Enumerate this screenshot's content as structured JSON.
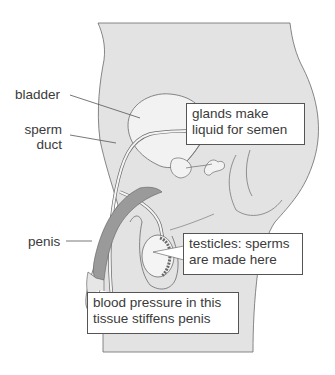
{
  "diagram": {
    "colors": {
      "background": "#ffffff",
      "body_fill": "#e3e3e3",
      "outline": "#6a6a6a",
      "penis_tissue": "#9a9a9a",
      "organ_fill": "#f2f2f2",
      "box_border": "#555555",
      "text": "#3a3a3a"
    },
    "labels": {
      "bladder": "bladder",
      "sperm_duct_line1": "sperm",
      "sperm_duct_line2": "duct",
      "penis": "penis"
    },
    "callouts": {
      "glands": {
        "line1": "glands make",
        "line2": "liquid for semen"
      },
      "testicles": {
        "line1": "testicles: sperms",
        "line2": "are made here"
      },
      "erectile_tissue": {
        "line1": "blood pressure in this",
        "line2": "tissue stiffens penis"
      }
    }
  }
}
